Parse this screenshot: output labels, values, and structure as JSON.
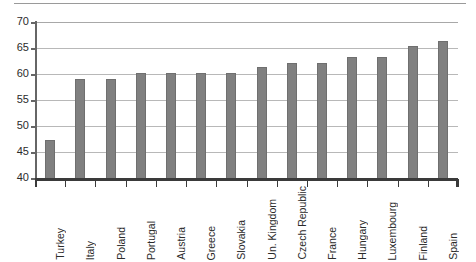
{
  "chart_data": {
    "type": "bar",
    "title": "",
    "subtitle": "",
    "xlabel": "",
    "ylabel": "",
    "ylim": [
      40,
      70
    ],
    "ytick_step": 5,
    "yticks": [
      40,
      45,
      50,
      55,
      60,
      65,
      70
    ],
    "grid": true,
    "legend": false,
    "legend_position": "none",
    "orientation": "vertical",
    "bar_color": "#808080",
    "categories": [
      "Turkey",
      "Italy",
      "Poland",
      "Portugal",
      "Austria",
      "Greece",
      "Slovakia",
      "Un. Kingdom",
      "Czech Republic",
      "France",
      "Hungary",
      "Luxembourg",
      "Finland",
      "Spain"
    ],
    "values": [
      47.3,
      59.0,
      59.0,
      60.1,
      60.1,
      60.2,
      60.2,
      61.3,
      62.1,
      62.1,
      63.3,
      63.3,
      65.3,
      66.3
    ]
  },
  "axis": {
    "y_tick_labels": [
      "70",
      "65",
      "60",
      "55",
      "50",
      "45",
      "40"
    ]
  },
  "colors": {
    "bar": "#808080",
    "bar_edge": "#6f6f6f",
    "gridline": "#b8b8b8",
    "axis": "#3a3a3a",
    "text": "#2b2b2b",
    "background": "#ffffff"
  }
}
